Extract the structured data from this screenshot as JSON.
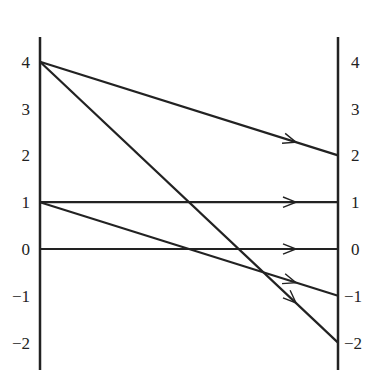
{
  "chart_data": {
    "type": "line",
    "title": "",
    "left_axis": {
      "ticks": [
        "4",
        "3",
        "2",
        "1",
        "0",
        "−1",
        "−2"
      ],
      "values": [
        4,
        3,
        2,
        1,
        0,
        -1,
        -2
      ]
    },
    "right_axis": {
      "ticks": [
        "4",
        "3",
        "2",
        "1",
        "0",
        "−1",
        "−2"
      ],
      "values": [
        4,
        3,
        2,
        1,
        0,
        -1,
        -2
      ]
    },
    "segments": [
      {
        "from": 4,
        "to": 2
      },
      {
        "from": 4,
        "to": -2
      },
      {
        "from": 1,
        "to": 1
      },
      {
        "from": 1,
        "to": -1
      },
      {
        "from": 0,
        "to": 0
      }
    ],
    "ylim": [
      -2.5,
      4.5
    ],
    "line_color": "#222222"
  }
}
